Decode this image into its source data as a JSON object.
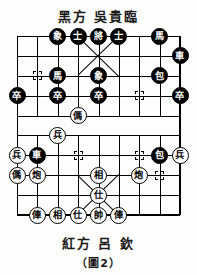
{
  "header": {
    "side_label_top": "黑方  吳貴臨",
    "side_label_bottom": "紅方  呂  欽",
    "figure_caption": "（圖2）"
  },
  "colors": {
    "board_line": "#000000",
    "black_piece_bg": "#000000",
    "black_piece_fg": "#ffffff",
    "red_piece_bg": "#ffffff",
    "red_piece_fg": "#000000",
    "page_bg": "#fdfdfb"
  },
  "board": {
    "files": 9,
    "ranks": 10,
    "river_present": true,
    "pieces": [
      {
        "id": "p01",
        "glyph": "象",
        "side": "black",
        "file": 3,
        "rank": 1
      },
      {
        "id": "p02",
        "glyph": "士",
        "side": "black",
        "file": 4,
        "rank": 1
      },
      {
        "id": "p03",
        "glyph": "將",
        "side": "black",
        "file": 5,
        "rank": 1
      },
      {
        "id": "p04",
        "glyph": "士",
        "side": "black",
        "file": 6,
        "rank": 1
      },
      {
        "id": "p05",
        "glyph": "馬",
        "side": "black",
        "file": 8,
        "rank": 1
      },
      {
        "id": "p06",
        "glyph": "車",
        "side": "black",
        "file": 9,
        "rank": 2
      },
      {
        "id": "p07",
        "glyph": "馬",
        "side": "black",
        "file": 3,
        "rank": 3
      },
      {
        "id": "p08",
        "glyph": "象",
        "side": "black",
        "file": 5,
        "rank": 3
      },
      {
        "id": "p09",
        "glyph": "包",
        "side": "black",
        "file": 8,
        "rank": 3
      },
      {
        "id": "p10",
        "glyph": "卒",
        "side": "black",
        "file": 1,
        "rank": 4
      },
      {
        "id": "p11",
        "glyph": "卒",
        "side": "black",
        "file": 3,
        "rank": 4
      },
      {
        "id": "p12",
        "glyph": "卒",
        "side": "black",
        "file": 5,
        "rank": 4
      },
      {
        "id": "p13",
        "glyph": "卒",
        "side": "black",
        "file": 9,
        "rank": 4
      },
      {
        "id": "p14",
        "glyph": "傌",
        "side": "red",
        "file": 4,
        "rank": 5
      },
      {
        "id": "p15",
        "glyph": "兵",
        "side": "red",
        "file": 3,
        "rank": 6
      },
      {
        "id": "p16",
        "glyph": "兵",
        "side": "red",
        "file": 1,
        "rank": 7
      },
      {
        "id": "p17",
        "glyph": "車",
        "side": "black",
        "file": 2,
        "rank": 7
      },
      {
        "id": "p18",
        "glyph": "包",
        "side": "black",
        "file": 8,
        "rank": 7
      },
      {
        "id": "p19",
        "glyph": "兵",
        "side": "red",
        "file": 9,
        "rank": 7
      },
      {
        "id": "p20",
        "glyph": "傌",
        "side": "red",
        "file": 1,
        "rank": 8
      },
      {
        "id": "p21",
        "glyph": "炮",
        "side": "red",
        "file": 2,
        "rank": 8
      },
      {
        "id": "p22",
        "glyph": "相",
        "side": "red",
        "file": 5,
        "rank": 8
      },
      {
        "id": "p23",
        "glyph": "炮",
        "side": "red",
        "file": 7,
        "rank": 8
      },
      {
        "id": "p24",
        "glyph": "仕",
        "side": "red",
        "file": 5,
        "rank": 9
      },
      {
        "id": "p25",
        "glyph": "俥",
        "side": "red",
        "file": 2,
        "rank": 10
      },
      {
        "id": "p26",
        "glyph": "相",
        "side": "red",
        "file": 3,
        "rank": 10
      },
      {
        "id": "p27",
        "glyph": "仕",
        "side": "red",
        "file": 4,
        "rank": 10
      },
      {
        "id": "p28",
        "glyph": "帥",
        "side": "red",
        "file": 5,
        "rank": 10
      },
      {
        "id": "p29",
        "glyph": "俥",
        "side": "red",
        "file": 6,
        "rank": 10
      }
    ],
    "point_markers": [
      {
        "file": 2,
        "rank": 3
      },
      {
        "file": 7,
        "rank": 4
      },
      {
        "file": 2,
        "rank": 7
      },
      {
        "file": 4,
        "rank": 7
      },
      {
        "file": 7,
        "rank": 7
      },
      {
        "file": 8,
        "rank": 8
      }
    ]
  }
}
